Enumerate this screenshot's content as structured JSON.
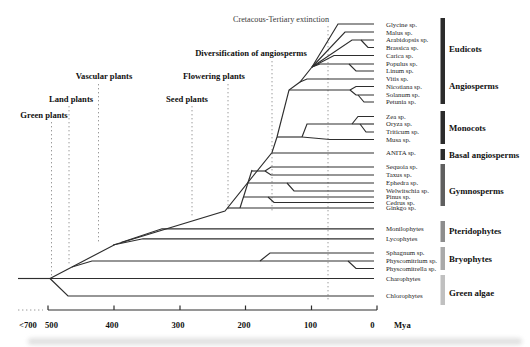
{
  "annotations": {
    "kt_extinction": "Cretacous-Tertiary extinction",
    "diversification": "Diversification of angiosperms",
    "vascular_plants": "Vascular plants",
    "flowering_plants": "Flowering plants",
    "land_plants": "Land plants",
    "seed_plants": "Seed plants",
    "green_plants": "Green plants"
  },
  "tips": [
    "Glycine sp.",
    "Malus sp.",
    "Arabidopsis sp.",
    "Brassica sp.",
    "Carica sp.",
    "Populus sp.",
    "Linum sp.",
    "Vitis sp.",
    "Nicotiana sp.",
    "Solanum sp.",
    "Petunia sp.",
    "Zea sp.",
    "Oryza sp.",
    "Triticum sp.",
    "Musa sp.",
    "ANITA sp.",
    "Sequoia sp.",
    "Taxus sp.",
    "Ephedra sp.",
    "Welwitschia sp.",
    "Pinus sp.",
    "Cedrus sp.",
    "Ginkgo sp.",
    "Monilophytes",
    "Lycophytes",
    "Sphagnum sp.",
    "Physcomitrium sp.",
    "Physcomitrella sp.",
    "Charophytes",
    "Chlorophytes"
  ],
  "groups": [
    "Eudicots",
    "Angiosperms",
    "Monocots",
    "Basal angiosperms",
    "Gymnosperms",
    "Pteridophytes",
    "Bryophytes",
    "Green algae"
  ],
  "axis": {
    "tick_labels": [
      "<700",
      "500",
      "400",
      "300",
      "200",
      "100",
      "0"
    ],
    "unit_label": "Mya"
  },
  "colors": {
    "branch": "#2e2e2e",
    "dotted_guide": "#9a9a9a",
    "bar_angiosperms": "#2b2b2b",
    "bar_monocots": "#2b2b2b",
    "bar_basal_angiosperms": "#2b2b2b",
    "bar_gymnosperms": "#5f5f5f",
    "bar_pteridophytes": "#8d8d8d",
    "bar_bryophytes": "#a9a9a9",
    "bar_green_algae": "#c0c0c0"
  }
}
